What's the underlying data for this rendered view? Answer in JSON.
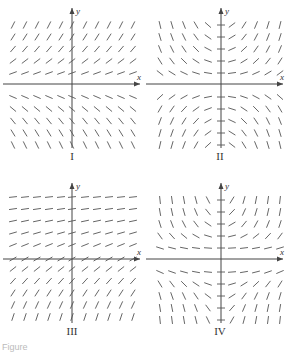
{
  "figure": {
    "panels": [
      {
        "id": "I",
        "label": "I",
        "x_axis_label": "x",
        "y_axis_label": "y",
        "field": "y"
      },
      {
        "id": "II",
        "label": "II",
        "x_axis_label": "x",
        "y_axis_label": "y",
        "field": "xy"
      },
      {
        "id": "III",
        "label": "III",
        "x_axis_label": "x",
        "y_axis_label": "y",
        "field": "exp_neg_y"
      },
      {
        "id": "IV",
        "label": "IV",
        "x_axis_label": "x",
        "y_axis_label": "y",
        "field": "x_ysq"
      }
    ],
    "caption": "Figure"
  },
  "colors": {
    "axis": "#444444",
    "segment": "#555555",
    "text": "#333333"
  }
}
